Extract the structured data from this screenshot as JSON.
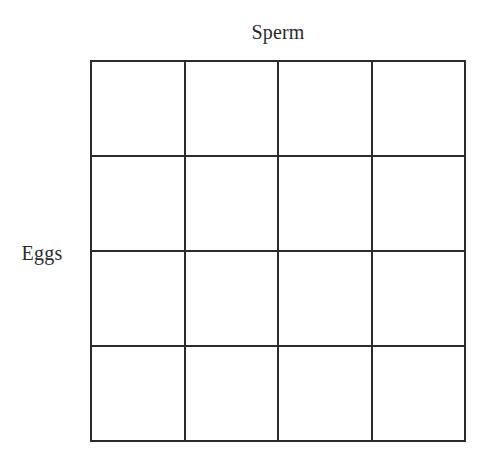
{
  "diagram": {
    "type": "punnett-square",
    "title": "",
    "column_axis_label": "Sperm",
    "row_axis_label": "Eggs",
    "grid": {
      "rows": 4,
      "columns": 4,
      "line_color": "#2b2b2b",
      "cell_fill": "#ffffff",
      "background": "#ffffff",
      "cells": [
        [
          "",
          "",
          "",
          ""
        ],
        [
          "",
          "",
          "",
          ""
        ],
        [
          "",
          "",
          "",
          ""
        ],
        [
          "",
          "",
          "",
          ""
        ]
      ]
    }
  }
}
